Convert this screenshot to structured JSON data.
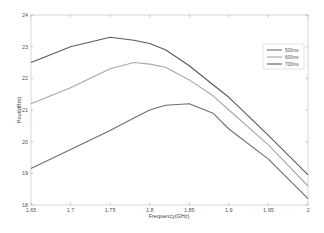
{
  "chart_data": {
    "type": "line",
    "title": "",
    "xlabel": "Frequency(GHz)",
    "ylabel": "Pout(dBm)",
    "xlim": [
      1.65,
      2.0
    ],
    "ylim": [
      18,
      24
    ],
    "grid": false,
    "legend_position": "upper right",
    "x_ticks": [
      "1.65",
      "1.7",
      "1.75",
      "1.8",
      "1.85",
      "1.9",
      "1.95",
      "2"
    ],
    "y_ticks": [
      "18",
      "19",
      "20",
      "21",
      "22",
      "23",
      "24"
    ],
    "x": [
      1.65,
      1.7,
      1.75,
      1.78,
      1.8,
      1.82,
      1.85,
      1.88,
      1.9,
      1.95,
      2.0
    ],
    "series": [
      {
        "name": "500ms",
        "color": "#6e6e6e",
        "values": [
          19.15,
          19.75,
          20.35,
          20.75,
          21.0,
          21.15,
          21.2,
          20.9,
          20.4,
          19.45,
          18.2
        ]
      },
      {
        "name": "600ms",
        "color": "#a8a8a8",
        "values": [
          21.2,
          21.7,
          22.3,
          22.5,
          22.45,
          22.35,
          21.95,
          21.45,
          21.0,
          19.9,
          18.6
        ]
      },
      {
        "name": "700ms",
        "color": "#5a5a5a",
        "values": [
          22.5,
          23.0,
          23.3,
          23.2,
          23.1,
          22.9,
          22.4,
          21.8,
          21.4,
          20.2,
          18.95
        ]
      }
    ]
  },
  "legend": {
    "items": [
      {
        "label": "500ms"
      },
      {
        "label": "600ms"
      },
      {
        "label": "700ms"
      }
    ]
  },
  "axes": {
    "xlabel": "Frequency(GHz)",
    "ylabel": "Pout(dBm)"
  }
}
